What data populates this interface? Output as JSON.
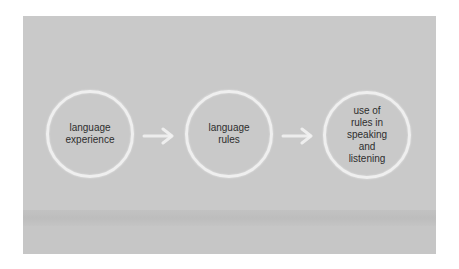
{
  "diagram": {
    "type": "flow",
    "direction": "left-to-right",
    "colors": {
      "panel": "#c9c9c9",
      "circle_stroke": "#f6f6f6",
      "text": "#2e2e2e",
      "arrow": "#f2f2f2"
    },
    "nodes": [
      {
        "id": "n1",
        "label": "language\nexperience"
      },
      {
        "id": "n2",
        "label": "language\nrules"
      },
      {
        "id": "n3",
        "label": "use of\nrules in\nspeaking\nand\nlistening"
      }
    ],
    "edges": [
      {
        "from": "n1",
        "to": "n2",
        "icon": "arrow-right-icon"
      },
      {
        "from": "n2",
        "to": "n3",
        "icon": "arrow-right-icon"
      }
    ]
  }
}
